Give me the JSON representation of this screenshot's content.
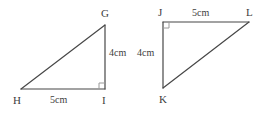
{
  "figure": {
    "stroke_color": "#474747",
    "background_color": "#ffffff",
    "text_color": "#3d3d3d",
    "triangles": [
      {
        "name": "triangle-GHI",
        "vertices": [
          {
            "label": "G",
            "x": 105,
            "y": 25
          },
          {
            "label": "H",
            "x": 21,
            "y": 89
          },
          {
            "label": "I",
            "x": 105,
            "y": 89
          }
        ],
        "right_angle_at": "I",
        "measures": [
          {
            "label": "4cm",
            "side": "GI"
          },
          {
            "label": "5cm",
            "side": "HI"
          }
        ]
      },
      {
        "name": "triangle-JKL",
        "vertices": [
          {
            "label": "J",
            "x": 163,
            "y": 22
          },
          {
            "label": "K",
            "x": 163,
            "y": 88
          },
          {
            "label": "L",
            "x": 249,
            "y": 22
          }
        ],
        "right_angle_at": "J",
        "measures": [
          {
            "label": "4cm",
            "side": "JK"
          },
          {
            "label": "5cm",
            "side": "JL"
          }
        ]
      }
    ],
    "labels": {
      "g": "G",
      "h": "H",
      "i": "I",
      "j": "J",
      "k": "K",
      "l": "L",
      "gi_measure": "4cm",
      "hi_measure": "5cm",
      "jk_measure": "4cm",
      "jl_measure": "5cm"
    }
  }
}
